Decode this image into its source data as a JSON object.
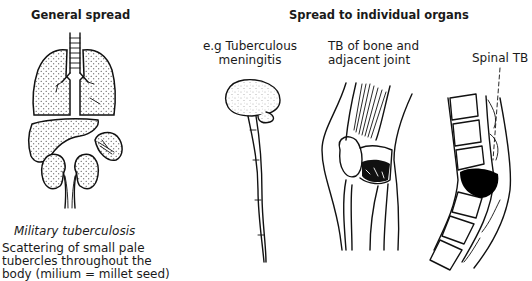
{
  "figure": {
    "sections": {
      "general": {
        "heading": "General spread",
        "illustration": "lungs-liver-spleen-kidneys-icon",
        "caption_title": "Military tuberculosis",
        "caption_lines": [
          "Scattering of small pale",
          "tubercles throughout the",
          "body (milium = millet seed)"
        ]
      },
      "organs": {
        "heading": "Spread to individual organs",
        "items": [
          {
            "label_lines": [
              "e.g Tuberculous",
              "meningitis"
            ],
            "illustration": "brain-spinal-cord-icon"
          },
          {
            "label_lines": [
              "TB of bone and",
              "adjacent joint"
            ],
            "illustration": "knee-joint-icon"
          },
          {
            "label_lines": [
              "Spinal TB"
            ],
            "illustration": "spine-vertebrae-icon"
          }
        ]
      }
    },
    "colors": {
      "ink": "#111111",
      "background": "#ffffff",
      "lesion": "#000000"
    }
  }
}
